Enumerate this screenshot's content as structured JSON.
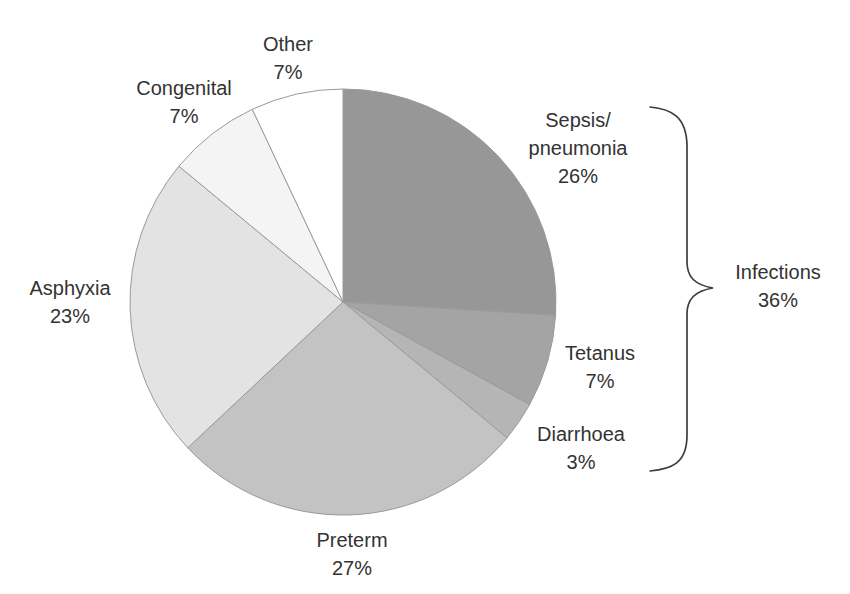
{
  "figure": {
    "background": "#ffffff",
    "text_color": "#333333",
    "brace_color": "#3d3d3d",
    "slice_stroke": "#9a9a9a"
  },
  "chart_data": {
    "type": "pie",
    "units": "%",
    "start_angle_deg_from_top": 0,
    "direction": "clockwise",
    "categories": [
      "Sepsis/pneumonia",
      "Tetanus",
      "Diarrhoea",
      "Preterm",
      "Asphyxia",
      "Congenital",
      "Other"
    ],
    "values": [
      26,
      7,
      3,
      27,
      23,
      7,
      7
    ],
    "colors": [
      "#979797",
      "#a4a4a4",
      "#b5b5b5",
      "#c3c3c3",
      "#e3e3e3",
      "#f4f4f4",
      "#ffffff"
    ],
    "annotation_group": {
      "label": "Infections",
      "value_label": "36%",
      "value": 36,
      "members": [
        "Sepsis/pneumonia",
        "Tetanus",
        "Diarrhoea"
      ]
    }
  },
  "labels": {
    "sepsis": {
      "lines": [
        "Sepsis/",
        "pneumonia",
        "26%"
      ]
    },
    "tetanus": {
      "lines": [
        "Tetanus",
        "7%"
      ]
    },
    "diarrhoea": {
      "lines": [
        "Diarrhoea",
        "3%"
      ]
    },
    "preterm": {
      "lines": [
        "Preterm",
        "27%"
      ]
    },
    "asphyxia": {
      "lines": [
        "Asphyxia",
        "23%"
      ]
    },
    "congenital": {
      "lines": [
        "Congenital",
        "7%"
      ]
    },
    "other": {
      "lines": [
        "Other",
        "7%"
      ]
    },
    "infections": {
      "lines": [
        "Infections",
        "36%"
      ]
    }
  }
}
